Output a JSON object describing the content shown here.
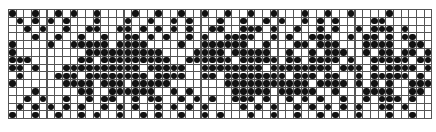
{
  "grid": {
    "cols": 55,
    "rows": 14,
    "cell_w": 7.7,
    "cell_h": 7.8,
    "line_color": "#555555",
    "dot_color": "#111111",
    "rows_data": [
      "x..x..x.x..x....x..x..x..x..x..x..x...x..x..x....x.....",
      ".x.x.x.x...x...x..x..x.x...x..x..x.x..x.x.x....xx......",
      "..x.x..x..xx..xx.x.x.x.x..xx..xxx.x..x..x.x..x.xxx.x...",
      "...x..x..x..x..xx.x.x..x.x..xxxx..x.x..xxx..x.xx.x.xx..",
      "x....x..xxxxx.xxxx....x..xxxxxx..x...xx.xxx...xxxx..xx.",
      "x.........xxxxxxxxxx....xxxx.xxxxx..x..x.xxx..x.xx.xx.x",
      "xxx......xx.xxxxxxxxx..xxxxxx.xxxxx.xx.xxxx.x..xxxxx.xx",
      "xx.x...xxxxxxxxxx.xxxxx..xxxxxxxx.xxxxxxxx.xxx.x.xxxx.x",
      ".x....xxx.xxxxxxxx.xxxx..xx.xxxxxxxx.xxx.xx..x.xxxxx.x.",
      "x......xxxx.xxx.xxxxx.......xxxxxxxxxxx.xxxx.x.x.x..xxx",
      "...x.....xx..xxxxxx..x.x.....xxxxx.xxxxx..x...xxxx..xx.",
      "..x.x..x..x.xx..x.xx..x.x.x..xxx.x..x.x.x..x..x.xxx.x..",
      ".x.x.x.x.x..x.x.x..x.x.x.x....x.x.x..x.x.x.x.x..xx.x...",
      "x..x..x..x.x..x..x.x..x..x.x...x..x..x..x.x..x...x..x.."
    ]
  }
}
